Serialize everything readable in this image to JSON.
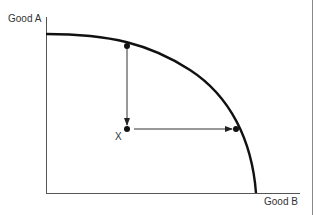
{
  "diagram": {
    "type": "production-possibilities-frontier",
    "axes": {
      "y_label": "Good A",
      "x_label": "Good B"
    },
    "points": [
      {
        "name": "X",
        "label": "X",
        "description": "inside frontier"
      },
      {
        "name": "top-point",
        "label": "",
        "description": "on frontier above X"
      },
      {
        "name": "right-point",
        "label": "",
        "description": "on frontier right of X"
      }
    ],
    "arrows": [
      {
        "from": "top-point",
        "to": "X",
        "direction": "down"
      },
      {
        "from": "X",
        "to": "right-point",
        "direction": "right"
      }
    ],
    "colors": {
      "curve": "#111111",
      "axis": "#555555",
      "text": "#333333"
    }
  }
}
